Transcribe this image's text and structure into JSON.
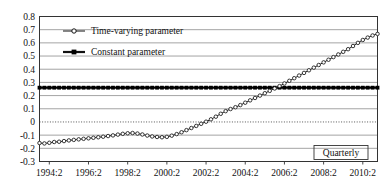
{
  "chart_data": {
    "type": "line",
    "title": "",
    "xlabel": "Quarterly",
    "ylabel": "",
    "ylim": [
      -0.3,
      0.8
    ],
    "ytick_labels": [
      "0.8",
      "0.7",
      "0.6",
      "0.5",
      "0.4",
      "0.3",
      "0.2",
      "0.1",
      "0",
      "-0.1",
      "-0.2",
      "-0.3"
    ],
    "ytick_values": [
      0.8,
      0.7,
      0.6,
      0.5,
      0.4,
      0.3,
      0.2,
      0.1,
      0,
      -0.1,
      -0.2,
      -0.3
    ],
    "xtick_labels": [
      "1994:2",
      "1996:2",
      "1998:2",
      "2000:2",
      "2002:2",
      "2004:2",
      "2006:2",
      "2008:2",
      "2010:2"
    ],
    "xtick_quarters": [
      2,
      10,
      18,
      26,
      34,
      42,
      50,
      58,
      66
    ],
    "grid": true,
    "zero_line": "dotted",
    "legend_position": "upper-left",
    "x_start_label": "1994:1",
    "x_end_label": "2011:2",
    "n_points": 70,
    "series": [
      {
        "name": "Time-varying parameter",
        "marker": "open-circle",
        "color": "#222222",
        "values": [
          -0.16,
          -0.163,
          -0.158,
          -0.152,
          -0.15,
          -0.145,
          -0.14,
          -0.136,
          -0.132,
          -0.128,
          -0.124,
          -0.12,
          -0.116,
          -0.112,
          -0.107,
          -0.102,
          -0.096,
          -0.09,
          -0.086,
          -0.084,
          -0.088,
          -0.095,
          -0.103,
          -0.11,
          -0.114,
          -0.116,
          -0.113,
          -0.104,
          -0.092,
          -0.078,
          -0.062,
          -0.046,
          -0.03,
          -0.014,
          0.002,
          0.02,
          0.04,
          0.062,
          0.082,
          0.098,
          0.112,
          0.128,
          0.146,
          0.164,
          0.182,
          0.2,
          0.218,
          0.236,
          0.254,
          0.272,
          0.292,
          0.312,
          0.332,
          0.352,
          0.372,
          0.392,
          0.412,
          0.432,
          0.452,
          0.472,
          0.492,
          0.512,
          0.532,
          0.552,
          0.576,
          0.6,
          0.622,
          0.64,
          0.656,
          0.668,
          0.678,
          0.68,
          0.66,
          0.62,
          0.572,
          0.532,
          0.512,
          0.508,
          0.51,
          0.511,
          0.512,
          0.512,
          0.513,
          0.513,
          0.514,
          0.514,
          0.515
        ]
      },
      {
        "name": "Constant parameter",
        "marker": "filled-square",
        "color": "#000000",
        "constant_value": 0.26
      }
    ]
  },
  "legend": {
    "items": [
      {
        "label": "Time-varying parameter",
        "marker": "open-circle"
      },
      {
        "label": "Constant parameter",
        "marker": "filled-square"
      }
    ]
  },
  "annotations": {
    "quarterly_note": "Quarterly"
  }
}
